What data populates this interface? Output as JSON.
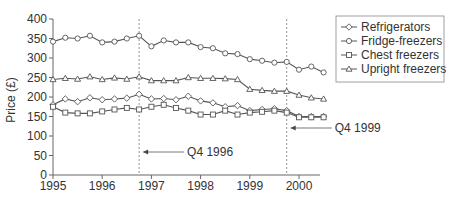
{
  "chart_data": {
    "type": "line",
    "title": "",
    "xlabel": "",
    "ylabel": "Price (£)",
    "ylim": [
      0,
      400
    ],
    "xlim": [
      1995,
      2000.5
    ],
    "yticks": [
      0,
      50,
      100,
      150,
      200,
      250,
      300,
      350,
      400
    ],
    "xticks": [
      1995,
      1996,
      1997,
      1998,
      1999,
      2000
    ],
    "grid": false,
    "legend_position": "upper right (outside plot)",
    "x": [
      1995.0,
      1995.25,
      1995.5,
      1995.75,
      1996.0,
      1996.25,
      1996.5,
      1996.75,
      1997.0,
      1997.25,
      1997.5,
      1997.75,
      1998.0,
      1998.25,
      1998.5,
      1998.75,
      1999.0,
      1999.25,
      1999.5,
      1999.75,
      2000.0,
      2000.25,
      2000.5
    ],
    "series": [
      {
        "name": "Refrigerators",
        "marker": "diamond",
        "values": [
          180,
          195,
          188,
          198,
          193,
          195,
          197,
          207,
          195,
          196,
          193,
          202,
          190,
          185,
          175,
          178,
          165,
          168,
          170,
          165,
          150,
          150,
          150
        ]
      },
      {
        "name": "Fridge-freezers",
        "marker": "circle",
        "values": [
          342,
          352,
          350,
          357,
          340,
          342,
          350,
          357,
          330,
          345,
          340,
          340,
          328,
          325,
          312,
          310,
          297,
          293,
          288,
          290,
          270,
          278,
          263
        ]
      },
      {
        "name": "Chest freezers",
        "marker": "square",
        "values": [
          175,
          160,
          158,
          158,
          163,
          168,
          172,
          168,
          175,
          180,
          172,
          165,
          155,
          155,
          165,
          155,
          160,
          162,
          165,
          160,
          148,
          148,
          148
        ]
      },
      {
        "name": "Upright freezers",
        "marker": "triangle",
        "values": [
          245,
          248,
          246,
          252,
          245,
          249,
          246,
          252,
          242,
          242,
          242,
          250,
          248,
          248,
          247,
          245,
          220,
          217,
          215,
          215,
          205,
          198,
          195
        ]
      }
    ],
    "annotations": [
      {
        "label": "Q4 1996",
        "x": 1996.75,
        "style": "dashed vertical line with arrow"
      },
      {
        "label": "Q4 1999",
        "x": 1999.75,
        "style": "dashed vertical line with arrow"
      }
    ]
  },
  "colors": {
    "line": "#555555",
    "axis": "#666666",
    "text": "#333333",
    "background": "#ffffff"
  }
}
